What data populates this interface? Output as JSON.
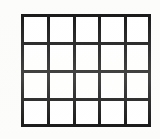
{
  "figure": {
    "kind": "empty-grid-table",
    "columns": 5,
    "rows": 4,
    "cell_text": [
      [
        "",
        "",
        "",
        "",
        ""
      ],
      [
        "",
        "",
        "",
        "",
        ""
      ],
      [
        "",
        "",
        "",
        "",
        ""
      ],
      [
        "",
        "",
        "",
        "",
        ""
      ]
    ],
    "geometry": {
      "left": 21,
      "top": 14,
      "right": 151,
      "bottom": 127,
      "vertical_line_x": [
        21,
        47,
        73,
        98,
        124,
        150
      ],
      "horizontal_line_y": [
        14,
        42,
        70,
        98,
        126
      ],
      "line_thickness": 3,
      "outer_line_thickness": 3
    },
    "colors": {
      "line": "#111111",
      "cell_fill": "#ffffff",
      "page_background": "#fcfcfb"
    }
  },
  "canvas": {
    "width": 160,
    "height": 139
  }
}
